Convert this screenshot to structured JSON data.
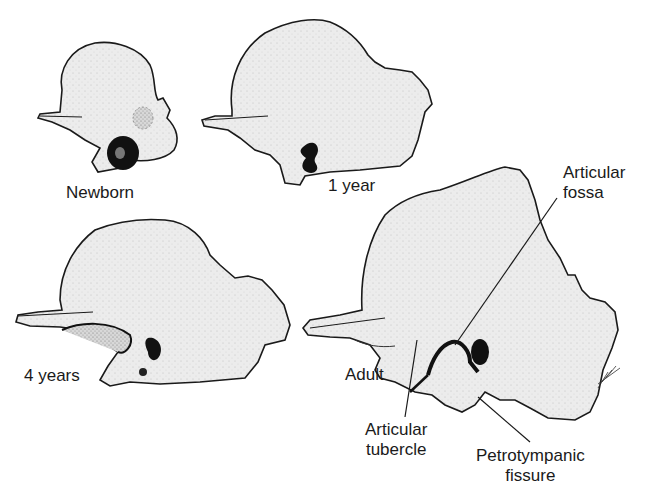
{
  "figure": {
    "stages": [
      {
        "id": "newborn",
        "label": "Newborn"
      },
      {
        "id": "one-year",
        "label": "1 year"
      },
      {
        "id": "four-years",
        "label": "4 years"
      },
      {
        "id": "adult",
        "label": "Adult"
      }
    ],
    "annotations": {
      "articular_fossa": {
        "line1": "Articular",
        "line2": "fossa"
      },
      "articular_tubercle": {
        "line1": "Articular",
        "line2": "tubercle"
      },
      "petrotympanic_fissure": {
        "line1": "Petrotympanic",
        "line2": "fissure"
      }
    },
    "artist_signature": "ASE",
    "colors": {
      "bone_fill": "#ececec",
      "outline": "#1a1a1a",
      "opening": "#111111",
      "background": "#ffffff"
    }
  }
}
